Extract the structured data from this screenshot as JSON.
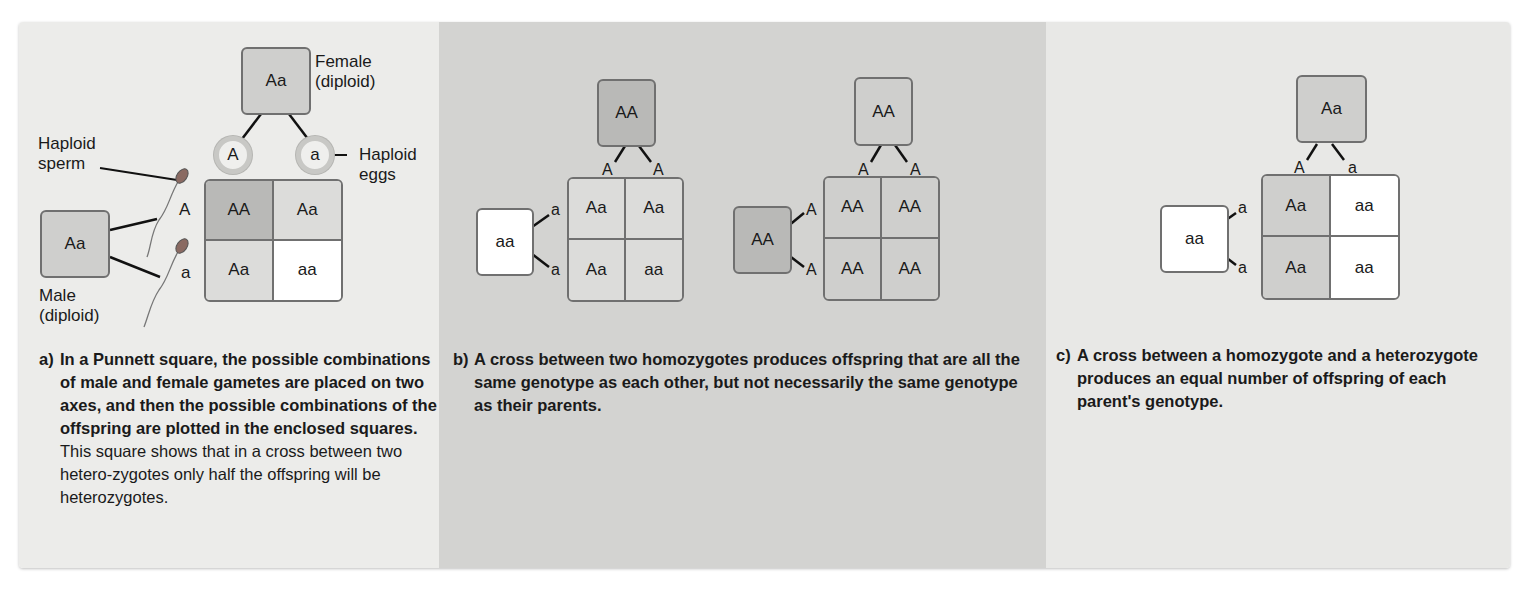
{
  "panel_a": {
    "female": {
      "genotype": "Aa",
      "label_line1": "Female",
      "label_line2": "(diploid)"
    },
    "male": {
      "genotype": "Aa",
      "label_line1": "Male",
      "label_line2": "(diploid)"
    },
    "sperm_label": {
      "line1": "Haploid",
      "line2": "sperm"
    },
    "eggs_label": {
      "line1": "Haploid",
      "line2": "eggs"
    },
    "eggs": [
      "A",
      "a"
    ],
    "sperm": [
      "A",
      "a"
    ],
    "cells": [
      "AA",
      "Aa",
      "Aa",
      "aa"
    ],
    "caption": {
      "tag": "a)",
      "bold": "In a Punnett square, the possible combinations of male and female gametes are placed on two axes, and then the possible combinations of the offspring are plotted in the enclosed squares.",
      "normal": " This square shows that in a cross between two hetero-zygotes only half the offspring will be heterozygotes."
    }
  },
  "panel_b": {
    "cross1": {
      "top_parent": "AA",
      "left_parent": "aa",
      "top_alleles": [
        "A",
        "A"
      ],
      "left_alleles": [
        "a",
        "a"
      ],
      "cells": [
        "Aa",
        "Aa",
        "Aa",
        "aa"
      ]
    },
    "cross2": {
      "top_parent": "AA",
      "left_parent": "AA",
      "top_alleles": [
        "A",
        "A"
      ],
      "left_alleles": [
        "A",
        "A"
      ],
      "cells": [
        "AA",
        "AA",
        "AA",
        "AA"
      ]
    },
    "caption": {
      "tag": "b)",
      "bold": "A cross between two homozygotes produces offspring that are all the same genotype as each other, but not necessarily the same genotype as their parents."
    }
  },
  "panel_c": {
    "top_parent": "Aa",
    "left_parent": "aa",
    "top_alleles": [
      "A",
      "a"
    ],
    "left_alleles": [
      "a",
      "a"
    ],
    "cells": [
      "Aa",
      "aa",
      "Aa",
      "aa"
    ],
    "caption": {
      "tag": "c)",
      "bold": "A cross between a homozygote and a heterozygote produces an equal number of offspring of each parent's genotype."
    }
  },
  "colors": {
    "panel_a_bg": "#ececea",
    "panel_b_bg": "#d3d3d1",
    "panel_c_bg": "#e8e8e6",
    "AA_fill": "#b9b9b7",
    "Aa_fill": "#cfcfcd",
    "aa_fill": "#ffffff",
    "border": "#707070"
  }
}
